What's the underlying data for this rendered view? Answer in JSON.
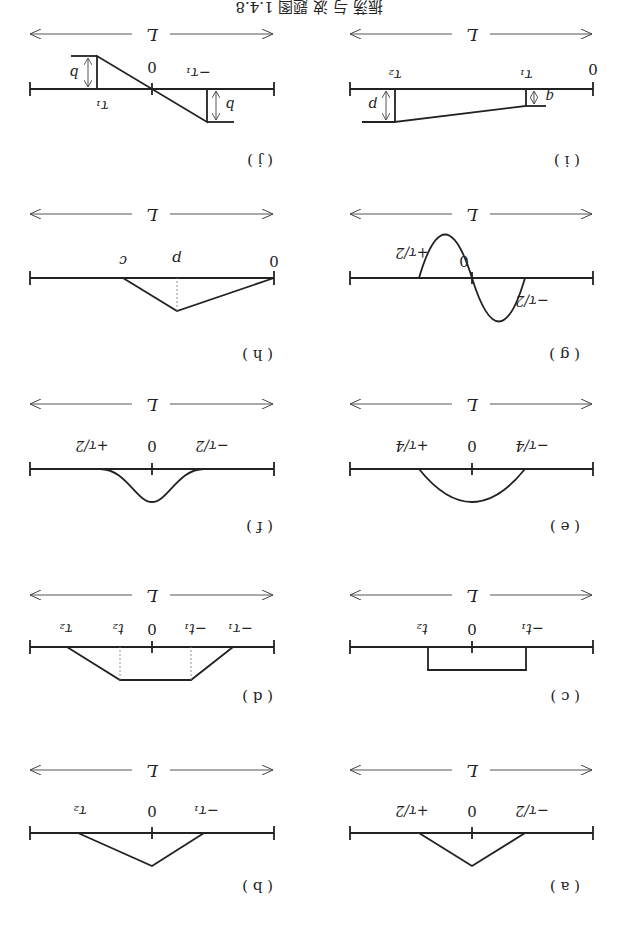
{
  "header": {
    "text": "振荡 与 波 题图 1.4.8"
  },
  "span_label": "L",
  "panels": [
    {
      "id": "a",
      "caption": "( a )",
      "labels": {
        "left": "−τ/2",
        "center": "0",
        "right": "+τ/2"
      },
      "shape": "triangle"
    },
    {
      "id": "b",
      "caption": "( b )",
      "labels": {
        "left": "−τ₁",
        "center": "0",
        "right": "τ₂"
      },
      "shape": "asymmetric-triangle"
    },
    {
      "id": "c",
      "caption": "( c )",
      "labels": {
        "left": "−t₁",
        "center": "0",
        "right": "t₂"
      },
      "shape": "rectangle"
    },
    {
      "id": "d",
      "caption": "( d )",
      "labels": {
        "l1": "−τ₁",
        "l2": "−t₁",
        "center": "0",
        "r2": "t₂",
        "r1": "τ₂"
      },
      "shape": "trapezoid"
    },
    {
      "id": "e",
      "caption": "( e )",
      "labels": {
        "left": "−τ/4",
        "center": "0",
        "right": "+τ/4"
      },
      "shape": "parabola"
    },
    {
      "id": "f",
      "caption": "( f )",
      "labels": {
        "left": "−τ/2",
        "center": "0",
        "right": "+τ/2"
      },
      "shape": "bell"
    },
    {
      "id": "g",
      "caption": "( g )",
      "labels": {
        "left": "−τ/2",
        "center": "0",
        "right": "+τ/2"
      },
      "shape": "sine"
    },
    {
      "id": "h",
      "caption": "( h )",
      "labels": {
        "left": "0",
        "mid": "p",
        "right": "c"
      },
      "shape": "triangle-offset"
    },
    {
      "id": "i",
      "caption": "( i )",
      "labels": {
        "left": "0",
        "t1": "τ₁",
        "t2": "τ₂",
        "q": "q",
        "p": "p"
      },
      "shape": "ramp"
    },
    {
      "id": "j",
      "caption": "( j )",
      "labels": {
        "left": "−τ₁",
        "center": "0",
        "right": "τ₁",
        "b1": "b",
        "b2": "b"
      },
      "shape": "antisymmetric"
    }
  ]
}
